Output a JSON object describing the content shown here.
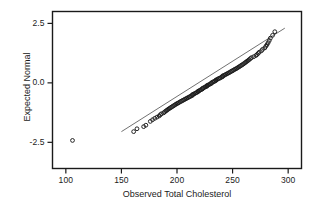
{
  "chart_data": {
    "type": "scatter",
    "title": "",
    "subtitle": "",
    "xlabel": "Observed Total Cholesterol",
    "ylabel": "Expected Normal",
    "xlim": [
      88,
      312
    ],
    "ylim": [
      -3.6,
      3.0
    ],
    "xticks": [
      100,
      150,
      200,
      250,
      300
    ],
    "xticklabels": [
      "100",
      "150",
      "200",
      "250",
      "300"
    ],
    "yticks": [
      2.5,
      0.0,
      -2.5
    ],
    "yticklabels": [
      "2.5",
      "0.0",
      "-2.5"
    ],
    "grid": false,
    "legend": null,
    "marker": "open-circle",
    "marker_color": "#1a1a1a",
    "frame_color": "#1a1a1a",
    "background": "#ffffff",
    "reference_line": {
      "label": "normal reference line",
      "x": [
        150,
        297
      ],
      "y": [
        -2.05,
        2.3
      ],
      "color": "#4d4d4d"
    },
    "annotations": [
      {
        "label": "low outlier",
        "x": 106,
        "y": -2.42
      }
    ],
    "points": [
      {
        "x": 106,
        "y": -2.42
      },
      {
        "x": 161,
        "y": -2.05
      },
      {
        "x": 164,
        "y": -1.93
      },
      {
        "x": 170,
        "y": -1.84
      },
      {
        "x": 172,
        "y": -1.78
      },
      {
        "x": 176,
        "y": -1.62
      },
      {
        "x": 178,
        "y": -1.55
      },
      {
        "x": 180,
        "y": -1.49
      },
      {
        "x": 182,
        "y": -1.44
      },
      {
        "x": 184,
        "y": -1.39
      },
      {
        "x": 185,
        "y": -1.34
      },
      {
        "x": 186,
        "y": -1.3
      },
      {
        "x": 188,
        "y": -1.26
      },
      {
        "x": 189,
        "y": -1.22
      },
      {
        "x": 190,
        "y": -1.18
      },
      {
        "x": 191,
        "y": -1.15
      },
      {
        "x": 192,
        "y": -1.11
      },
      {
        "x": 193,
        "y": -1.08
      },
      {
        "x": 194,
        "y": -1.05
      },
      {
        "x": 195,
        "y": -1.02
      },
      {
        "x": 196,
        "y": -0.99
      },
      {
        "x": 197,
        "y": -0.96
      },
      {
        "x": 198,
        "y": -0.93
      },
      {
        "x": 199,
        "y": -0.9
      },
      {
        "x": 200,
        "y": -0.87
      },
      {
        "x": 201,
        "y": -0.85
      },
      {
        "x": 202,
        "y": -0.82
      },
      {
        "x": 203,
        "y": -0.79
      },
      {
        "x": 204,
        "y": -0.77
      },
      {
        "x": 205,
        "y": -0.74
      },
      {
        "x": 206,
        "y": -0.72
      },
      {
        "x": 207,
        "y": -0.69
      },
      {
        "x": 208,
        "y": -0.67
      },
      {
        "x": 209,
        "y": -0.64
      },
      {
        "x": 210,
        "y": -0.62
      },
      {
        "x": 211,
        "y": -0.59
      },
      {
        "x": 212,
        "y": -0.57
      },
      {
        "x": 213,
        "y": -0.54
      },
      {
        "x": 214,
        "y": -0.52
      },
      {
        "x": 214,
        "y": -0.49
      },
      {
        "x": 215,
        "y": -0.47
      },
      {
        "x": 216,
        "y": -0.45
      },
      {
        "x": 217,
        "y": -0.42
      },
      {
        "x": 218,
        "y": -0.4
      },
      {
        "x": 219,
        "y": -0.37
      },
      {
        "x": 219,
        "y": -0.35
      },
      {
        "x": 220,
        "y": -0.33
      },
      {
        "x": 221,
        "y": -0.3
      },
      {
        "x": 222,
        "y": -0.28
      },
      {
        "x": 223,
        "y": -0.25
      },
      {
        "x": 223,
        "y": -0.23
      },
      {
        "x": 224,
        "y": -0.21
      },
      {
        "x": 225,
        "y": -0.18
      },
      {
        "x": 226,
        "y": -0.16
      },
      {
        "x": 227,
        "y": -0.14
      },
      {
        "x": 227,
        "y": -0.11
      },
      {
        "x": 228,
        "y": -0.09
      },
      {
        "x": 229,
        "y": -0.07
      },
      {
        "x": 230,
        "y": -0.04
      },
      {
        "x": 231,
        "y": -0.02
      },
      {
        "x": 231,
        "y": 0.0
      },
      {
        "x": 232,
        "y": 0.03
      },
      {
        "x": 233,
        "y": 0.05
      },
      {
        "x": 234,
        "y": 0.07
      },
      {
        "x": 235,
        "y": 0.1
      },
      {
        "x": 235,
        "y": 0.12
      },
      {
        "x": 236,
        "y": 0.14
      },
      {
        "x": 237,
        "y": 0.17
      },
      {
        "x": 238,
        "y": 0.19
      },
      {
        "x": 239,
        "y": 0.21
      },
      {
        "x": 240,
        "y": 0.24
      },
      {
        "x": 241,
        "y": 0.26
      },
      {
        "x": 241,
        "y": 0.29
      },
      {
        "x": 242,
        "y": 0.31
      },
      {
        "x": 243,
        "y": 0.33
      },
      {
        "x": 244,
        "y": 0.36
      },
      {
        "x": 245,
        "y": 0.38
      },
      {
        "x": 246,
        "y": 0.41
      },
      {
        "x": 247,
        "y": 0.43
      },
      {
        "x": 248,
        "y": 0.46
      },
      {
        "x": 249,
        "y": 0.49
      },
      {
        "x": 250,
        "y": 0.51
      },
      {
        "x": 251,
        "y": 0.54
      },
      {
        "x": 252,
        "y": 0.57
      },
      {
        "x": 253,
        "y": 0.59
      },
      {
        "x": 254,
        "y": 0.62
      },
      {
        "x": 255,
        "y": 0.65
      },
      {
        "x": 256,
        "y": 0.68
      },
      {
        "x": 257,
        "y": 0.71
      },
      {
        "x": 258,
        "y": 0.74
      },
      {
        "x": 259,
        "y": 0.77
      },
      {
        "x": 260,
        "y": 0.8
      },
      {
        "x": 261,
        "y": 0.84
      },
      {
        "x": 262,
        "y": 0.87
      },
      {
        "x": 263,
        "y": 0.91
      },
      {
        "x": 264,
        "y": 0.94
      },
      {
        "x": 265,
        "y": 0.98
      },
      {
        "x": 266,
        "y": 1.02
      },
      {
        "x": 267,
        "y": 1.06
      },
      {
        "x": 269,
        "y": 1.1
      },
      {
        "x": 271,
        "y": 1.15
      },
      {
        "x": 272,
        "y": 1.19
      },
      {
        "x": 273,
        "y": 1.24
      },
      {
        "x": 274,
        "y": 1.29
      },
      {
        "x": 276,
        "y": 1.35
      },
      {
        "x": 277,
        "y": 1.41
      },
      {
        "x": 279,
        "y": 1.47
      },
      {
        "x": 280,
        "y": 1.54
      },
      {
        "x": 281,
        "y": 1.61
      },
      {
        "x": 282,
        "y": 1.69
      },
      {
        "x": 283,
        "y": 1.78
      },
      {
        "x": 284,
        "y": 1.88
      },
      {
        "x": 286,
        "y": 2.0
      },
      {
        "x": 288,
        "y": 2.15
      }
    ]
  }
}
